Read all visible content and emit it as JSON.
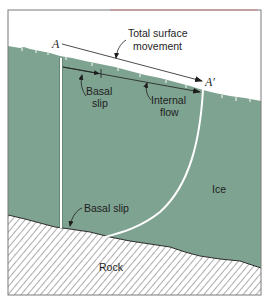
{
  "figure": {
    "type": "glacier-movement-cross-section",
    "colors": {
      "ice": "#7fa391",
      "ice_dark": "#6f9584",
      "rock_hatch": "#555555",
      "frame": "#777777",
      "frame_top_accent": "#c87a7a",
      "marker_line": "#ffffff",
      "ink": "#1e1e1e"
    },
    "points": {
      "A": "A",
      "A_prime": "A′"
    },
    "labels": {
      "total_surface_movement_line1": "Total surface",
      "total_surface_movement_line2": "movement",
      "basal_slip_upper_line1": "Basal",
      "basal_slip_upper_line2": "slip",
      "internal_flow_line1": "Internal",
      "internal_flow_line2": "flow",
      "ice": "Ice",
      "basal_slip_lower": "Basal slip",
      "rock": "Rock"
    }
  }
}
